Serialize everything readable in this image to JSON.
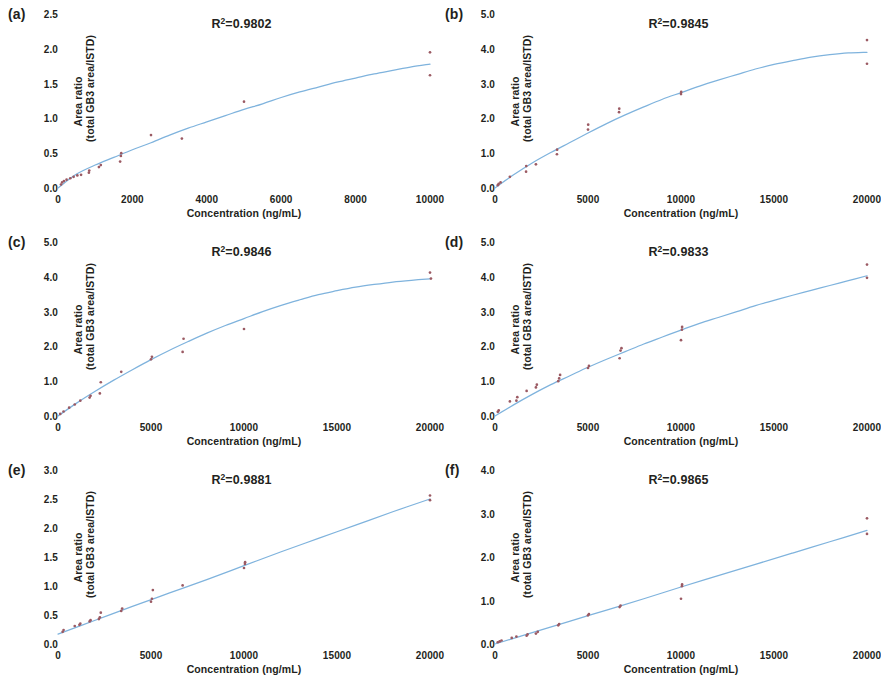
{
  "figure": {
    "panel_count": 6,
    "curve_color": "#7FB3DD",
    "point_color": "#9B5A63",
    "text_color": "#231f20",
    "background": "#ffffff"
  },
  "common": {
    "xlabel": "Concentration (ng/mL)",
    "ylabel_line1": "Area ratio",
    "ylabel_line2": "(total GB3 area/ISTD)",
    "r2_prefix": "R",
    "r2_sup": "2",
    "r2_eq": "="
  },
  "chart_data": [
    {
      "panel": "(a)",
      "type": "scatter",
      "title": "",
      "r2": "0.9802",
      "r2_text": "R²=0.9802",
      "xlabel": "Concentration (ng/mL)",
      "ylabel": "Area ratio (total GB3 area/ISTD)",
      "xlim": [
        0,
        10000
      ],
      "ylim": [
        0.0,
        2.5
      ],
      "xticks": [
        0,
        2000,
        4000,
        6000,
        8000,
        10000
      ],
      "xticklabels": [
        "0",
        "2000",
        "4000",
        "6000",
        "8000",
        "10000"
      ],
      "yticks": [
        0.0,
        0.5,
        1.0,
        1.5,
        2.0,
        2.5
      ],
      "yticklabels": [
        "0.0",
        "0.5",
        "1.0",
        "1.5",
        "2.0",
        "2.5"
      ],
      "grid": false,
      "legend": "none",
      "points": [
        [
          80,
          0.05
        ],
        [
          110,
          0.08
        ],
        [
          160,
          0.1
        ],
        [
          230,
          0.12
        ],
        [
          330,
          0.14
        ],
        [
          420,
          0.16
        ],
        [
          520,
          0.18
        ],
        [
          620,
          0.19
        ],
        [
          830,
          0.22
        ],
        [
          840,
          0.25
        ],
        [
          1100,
          0.3
        ],
        [
          1150,
          0.33
        ],
        [
          1670,
          0.38
        ],
        [
          1690,
          0.46
        ],
        [
          1700,
          0.5
        ],
        [
          2500,
          0.76
        ],
        [
          3330,
          0.71
        ],
        [
          5000,
          1.24
        ],
        [
          10000,
          1.95
        ],
        [
          10000,
          1.62
        ]
      ],
      "curve": [
        [
          0,
          0.0
        ],
        [
          500,
          0.2
        ],
        [
          1000,
          0.33
        ],
        [
          1500,
          0.44
        ],
        [
          2000,
          0.55
        ],
        [
          2500,
          0.65
        ],
        [
          3000,
          0.76
        ],
        [
          3500,
          0.86
        ],
        [
          4000,
          0.95
        ],
        [
          4500,
          1.04
        ],
        [
          5000,
          1.13
        ],
        [
          5500,
          1.21
        ],
        [
          6000,
          1.3
        ],
        [
          6500,
          1.38
        ],
        [
          7000,
          1.45
        ],
        [
          7500,
          1.52
        ],
        [
          8000,
          1.58
        ],
        [
          8500,
          1.64
        ],
        [
          9000,
          1.69
        ],
        [
          9500,
          1.74
        ],
        [
          10000,
          1.78
        ]
      ]
    },
    {
      "panel": "(b)",
      "type": "scatter",
      "title": "",
      "r2": "0.9845",
      "r2_text": "R²=0.9845",
      "xlabel": "Concentration (ng/mL)",
      "ylabel": "Area ratio (total GB3 area/ISTD)",
      "xlim": [
        0,
        20000
      ],
      "ylim": [
        0.0,
        5.0
      ],
      "xticks": [
        0,
        5000,
        10000,
        15000,
        20000
      ],
      "xticklabels": [
        "0",
        "5000",
        "10000",
        "15000",
        "20000"
      ],
      "yticks": [
        0.0,
        1.0,
        2.0,
        3.0,
        4.0,
        5.0
      ],
      "yticklabels": [
        "0.0",
        "1.0",
        "2.0",
        "3.0",
        "4.0",
        "5.0"
      ],
      "grid": false,
      "legend": "none",
      "points": [
        [
          150,
          0.08
        ],
        [
          200,
          0.12
        ],
        [
          300,
          0.16
        ],
        [
          800,
          0.32
        ],
        [
          1670,
          0.47
        ],
        [
          1680,
          0.63
        ],
        [
          2200,
          0.68
        ],
        [
          3330,
          0.97
        ],
        [
          3340,
          1.1
        ],
        [
          5000,
          1.68
        ],
        [
          5010,
          1.82
        ],
        [
          6670,
          2.18
        ],
        [
          6680,
          2.28
        ],
        [
          10000,
          2.7
        ],
        [
          10010,
          2.76
        ],
        [
          20000,
          4.25
        ],
        [
          20000,
          3.57
        ]
      ],
      "curve": [
        [
          0,
          0.0
        ],
        [
          1000,
          0.38
        ],
        [
          2000,
          0.72
        ],
        [
          3000,
          1.02
        ],
        [
          4000,
          1.3
        ],
        [
          5000,
          1.58
        ],
        [
          6000,
          1.85
        ],
        [
          7000,
          2.1
        ],
        [
          8000,
          2.33
        ],
        [
          9000,
          2.55
        ],
        [
          10000,
          2.74
        ],
        [
          11000,
          2.93
        ],
        [
          12000,
          3.1
        ],
        [
          13000,
          3.26
        ],
        [
          14000,
          3.42
        ],
        [
          15000,
          3.55
        ],
        [
          16000,
          3.66
        ],
        [
          17000,
          3.76
        ],
        [
          18000,
          3.83
        ],
        [
          19000,
          3.88
        ],
        [
          20000,
          3.9
        ]
      ]
    },
    {
      "panel": "(c)",
      "type": "scatter",
      "title": "",
      "r2": "0.9846",
      "r2_text": "R²=0.9846",
      "xlabel": "Concentration (ng/mL)",
      "ylabel": "Area ratio (total GB3 area/ISTD)",
      "xlim": [
        0,
        20000
      ],
      "ylim": [
        0.0,
        5.0
      ],
      "xticks": [
        0,
        5000,
        10000,
        15000,
        20000
      ],
      "xticklabels": [
        "0",
        "5000",
        "10000",
        "15000",
        "20000"
      ],
      "yticks": [
        0.0,
        1.0,
        2.0,
        3.0,
        4.0,
        5.0
      ],
      "yticklabels": [
        "0.0",
        "1.0",
        "2.0",
        "3.0",
        "4.0",
        "5.0"
      ],
      "grid": false,
      "legend": "none",
      "points": [
        [
          120,
          0.06
        ],
        [
          300,
          0.13
        ],
        [
          600,
          0.24
        ],
        [
          900,
          0.33
        ],
        [
          1200,
          0.44
        ],
        [
          1700,
          0.53
        ],
        [
          1750,
          0.58
        ],
        [
          2250,
          0.65
        ],
        [
          2300,
          0.97
        ],
        [
          3400,
          1.27
        ],
        [
          5000,
          1.63
        ],
        [
          5050,
          1.7
        ],
        [
          6700,
          1.84
        ],
        [
          6750,
          2.22
        ],
        [
          10000,
          2.5
        ],
        [
          20000,
          4.12
        ],
        [
          20050,
          3.95
        ]
      ],
      "curve": [
        [
          0,
          0.0
        ],
        [
          1000,
          0.37
        ],
        [
          2000,
          0.71
        ],
        [
          3000,
          1.03
        ],
        [
          4000,
          1.33
        ],
        [
          5000,
          1.62
        ],
        [
          6000,
          1.89
        ],
        [
          7000,
          2.14
        ],
        [
          8000,
          2.38
        ],
        [
          9000,
          2.6
        ],
        [
          10000,
          2.8
        ],
        [
          11000,
          3.0
        ],
        [
          12000,
          3.18
        ],
        [
          13000,
          3.34
        ],
        [
          14000,
          3.49
        ],
        [
          15000,
          3.6
        ],
        [
          16000,
          3.7
        ],
        [
          17000,
          3.78
        ],
        [
          18000,
          3.85
        ],
        [
          19000,
          3.9
        ],
        [
          20000,
          3.94
        ]
      ]
    },
    {
      "panel": "(d)",
      "type": "scatter",
      "title": "",
      "r2": "0.9833",
      "r2_text": "R²=0.9833",
      "xlabel": "Concentration (ng/mL)",
      "ylabel": "Area ratio (total GB3 area/ISTD)",
      "xlim": [
        0,
        20000
      ],
      "ylim": [
        0.0,
        5.0
      ],
      "xticks": [
        0,
        5000,
        10000,
        15000,
        20000
      ],
      "xticklabels": [
        "0",
        "5000",
        "10000",
        "15000",
        "20000"
      ],
      "yticks": [
        0.0,
        1.0,
        2.0,
        3.0,
        4.0,
        5.0
      ],
      "yticklabels": [
        "0.0",
        "1.0",
        "2.0",
        "3.0",
        "4.0",
        "5.0"
      ],
      "grid": false,
      "legend": "none",
      "points": [
        [
          150,
          0.12
        ],
        [
          200,
          0.16
        ],
        [
          800,
          0.42
        ],
        [
          1150,
          0.44
        ],
        [
          1200,
          0.54
        ],
        [
          1700,
          0.72
        ],
        [
          2200,
          0.82
        ],
        [
          2250,
          0.9
        ],
        [
          3400,
          1.0
        ],
        [
          3450,
          1.08
        ],
        [
          3500,
          1.18
        ],
        [
          5000,
          1.38
        ],
        [
          5050,
          1.44
        ],
        [
          6700,
          1.66
        ],
        [
          6750,
          1.88
        ],
        [
          6800,
          1.95
        ],
        [
          10000,
          2.18
        ],
        [
          10050,
          2.48
        ],
        [
          10060,
          2.56
        ],
        [
          20000,
          4.35
        ],
        [
          20000,
          3.97
        ]
      ],
      "curve": [
        [
          0,
          0.0
        ],
        [
          1000,
          0.32
        ],
        [
          2000,
          0.62
        ],
        [
          3000,
          0.9
        ],
        [
          4000,
          1.15
        ],
        [
          5000,
          1.4
        ],
        [
          6000,
          1.63
        ],
        [
          7000,
          1.85
        ],
        [
          8000,
          2.07
        ],
        [
          9000,
          2.27
        ],
        [
          10000,
          2.47
        ],
        [
          11000,
          2.66
        ],
        [
          12000,
          2.83
        ],
        [
          13000,
          3.0
        ],
        [
          14000,
          3.17
        ],
        [
          15000,
          3.32
        ],
        [
          16000,
          3.47
        ],
        [
          17000,
          3.61
        ],
        [
          18000,
          3.75
        ],
        [
          19000,
          3.89
        ],
        [
          20000,
          4.03
        ]
      ]
    },
    {
      "panel": "(e)",
      "type": "scatter",
      "title": "",
      "r2": "0.9881",
      "r2_text": "R²=0.9881",
      "xlabel": "Concentration (ng/mL)",
      "ylabel": "Area ratio (total GB3 area/ISTD)",
      "xlim": [
        0,
        20000
      ],
      "ylim": [
        0.0,
        3.0
      ],
      "xticks": [
        0,
        5000,
        10000,
        15000,
        20000
      ],
      "xticklabels": [
        "0",
        "5000",
        "10000",
        "15000",
        "20000"
      ],
      "yticks": [
        0.0,
        0.5,
        1.0,
        1.5,
        2.0,
        2.5,
        3.0
      ],
      "yticklabels": [
        "0.0",
        "0.5",
        "1.0",
        "1.5",
        "2.0",
        "2.5",
        "3.0"
      ],
      "grid": false,
      "legend": "none",
      "points": [
        [
          250,
          0.21
        ],
        [
          300,
          0.24
        ],
        [
          900,
          0.31
        ],
        [
          1150,
          0.33
        ],
        [
          1200,
          0.35
        ],
        [
          1700,
          0.39
        ],
        [
          1750,
          0.41
        ],
        [
          2200,
          0.43
        ],
        [
          2250,
          0.46
        ],
        [
          2300,
          0.54
        ],
        [
          3400,
          0.57
        ],
        [
          3450,
          0.61
        ],
        [
          5000,
          0.73
        ],
        [
          5050,
          0.78
        ],
        [
          5100,
          0.93
        ],
        [
          6700,
          1.01
        ],
        [
          10000,
          1.31
        ],
        [
          10050,
          1.38
        ],
        [
          10060,
          1.41
        ],
        [
          20000,
          2.56
        ],
        [
          20000,
          2.48
        ]
      ],
      "curve": [
        [
          0,
          0.17
        ],
        [
          2000,
          0.41
        ],
        [
          4000,
          0.65
        ],
        [
          6000,
          0.88
        ],
        [
          8000,
          1.11
        ],
        [
          10000,
          1.35
        ],
        [
          12000,
          1.59
        ],
        [
          14000,
          1.82
        ],
        [
          16000,
          2.05
        ],
        [
          18000,
          2.28
        ],
        [
          20000,
          2.5
        ]
      ]
    },
    {
      "panel": "(f)",
      "type": "scatter",
      "title": "",
      "r2": "0.9865",
      "r2_text": "R²=0.9865",
      "xlabel": "Concentration (ng/mL)",
      "ylabel": "Area ratio (total GB3 area/ISTD)",
      "xlim": [
        0,
        20000
      ],
      "ylim": [
        0.0,
        4.0
      ],
      "xticks": [
        0,
        5000,
        10000,
        15000,
        20000
      ],
      "xticklabels": [
        "0",
        "5000",
        "10000",
        "15000",
        "20000"
      ],
      "yticks": [
        0.0,
        1.0,
        2.0,
        3.0,
        4.0
      ],
      "yticklabels": [
        "0.0",
        "1.0",
        "2.0",
        "3.0",
        "4.0"
      ],
      "grid": false,
      "legend": "none",
      "points": [
        [
          150,
          0.04
        ],
        [
          250,
          0.06
        ],
        [
          350,
          0.08
        ],
        [
          900,
          0.14
        ],
        [
          1150,
          0.17
        ],
        [
          1700,
          0.19
        ],
        [
          1750,
          0.22
        ],
        [
          2200,
          0.24
        ],
        [
          2300,
          0.28
        ],
        [
          3400,
          0.43
        ],
        [
          3450,
          0.46
        ],
        [
          5000,
          0.66
        ],
        [
          5050,
          0.69
        ],
        [
          6700,
          0.85
        ],
        [
          6750,
          0.88
        ],
        [
          10000,
          1.04
        ],
        [
          10050,
          1.33
        ],
        [
          10060,
          1.37
        ],
        [
          20000,
          2.89
        ],
        [
          20000,
          2.53
        ]
      ],
      "curve": [
        [
          0,
          0.0
        ],
        [
          2000,
          0.26
        ],
        [
          4000,
          0.52
        ],
        [
          6000,
          0.78
        ],
        [
          8000,
          1.04
        ],
        [
          10000,
          1.31
        ],
        [
          12000,
          1.57
        ],
        [
          14000,
          1.83
        ],
        [
          16000,
          2.09
        ],
        [
          18000,
          2.35
        ],
        [
          20000,
          2.61
        ]
      ]
    }
  ]
}
